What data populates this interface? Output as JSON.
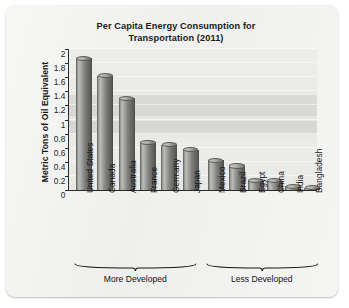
{
  "chart_data": {
    "type": "bar",
    "title": "Per Capita Energy Consumption for Transportation (2011)",
    "title_line1": "Per Capita Energy Consumption for",
    "title_line2": "Transportation (2011)",
    "xlabel": "",
    "ylabel": "Metric Tons of Oil Equivalent",
    "ylim": [
      0,
      2
    ],
    "ytick_labels": [
      "0",
      "0.2",
      "0.4",
      "0.6",
      "0.8",
      "1",
      "1.2",
      "1.4",
      "1.6",
      "1.8",
      "2"
    ],
    "ytick_values": [
      0,
      0.2,
      0.4,
      0.6,
      0.8,
      1,
      1.2,
      1.4,
      1.6,
      1.8,
      2
    ],
    "grid": true,
    "legend": "none",
    "categories": [
      "United States",
      "Canada",
      "Australia",
      "France",
      "Germany",
      "Japan",
      "Mexico",
      "Brazil",
      "Egypt",
      "China",
      "India",
      "Bangladesh"
    ],
    "values": [
      1.87,
      1.62,
      1.3,
      0.67,
      0.64,
      0.57,
      0.42,
      0.34,
      0.13,
      0.13,
      0.05,
      0.02
    ],
    "groups": [
      {
        "label": "More Developed",
        "categories": [
          "United States",
          "Canada",
          "Australia",
          "France",
          "Germany",
          "Japan"
        ]
      },
      {
        "label": "Less Developed",
        "categories": [
          "Mexico",
          "Brazil",
          "Egypt",
          "China",
          "India",
          "Bangladesh"
        ]
      }
    ],
    "bar_color": "#8a8a88",
    "plot_background": "#e9e9e7"
  },
  "figure": {
    "background": "#f3f3f1"
  }
}
